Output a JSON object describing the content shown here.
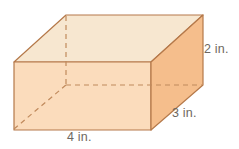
{
  "figure": {
    "name": "rectangular-prism",
    "type": "3d-solid-diagram",
    "background_color": "#ffffff"
  },
  "labels": {
    "height": "2 in.",
    "depth": "3 in.",
    "width": "4 in.",
    "text_color": "#6e6760"
  },
  "dimensions": {
    "width_value": 4,
    "depth_value": 3,
    "height_value": 2,
    "unit": "in."
  },
  "colors": {
    "top_face": "#f7e7d0",
    "front_face": "#fbdcbc",
    "right_face": "#f5be8c",
    "edge_stroke": "#b5794a",
    "hidden_edge_stroke": "#c08a5c"
  },
  "geometry": {
    "top_face_points": "14,62 66,15 203,15 151,62",
    "front_face_points": "14,62 151,62 151,130 14,130",
    "right_face_points": "151,62 203,15 203,85 151,130",
    "hidden_vertical": {
      "x1": 66,
      "y1": 16,
      "x2": 66,
      "y2": 85
    },
    "hidden_horizontal": {
      "x1": 66,
      "y1": 85,
      "x2": 202,
      "y2": 85
    },
    "hidden_diagonal": {
      "x1": 14,
      "y1": 129,
      "x2": 66,
      "y2": 85
    }
  }
}
